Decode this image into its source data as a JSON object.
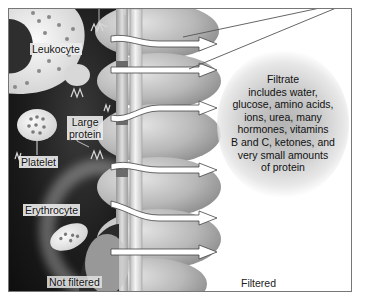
{
  "diagram": {
    "labels": {
      "leukocyte": "Leukocyte",
      "large_protein": "Large\nprotein",
      "large_protein_line1": "Large",
      "large_protein_line2": "protein",
      "platelet": "Platelet",
      "erythrocyte": "Erythrocyte",
      "not_filtered": "Not filtered",
      "filtered": "Filtered"
    },
    "filtrate": {
      "lines": [
        "Filtrate",
        "includes water,",
        "glucose, amino acids,",
        "ions, urea, many",
        "hormones, vitamins",
        "B and C, ketones, and",
        "very small amounts",
        "of protein"
      ]
    },
    "arrows_count": 6,
    "colors": {
      "blood_side_dark": "#1c1c1c",
      "membrane": "#e6e6e6",
      "podocyte": "#bdbdbd",
      "filtrate_bubble": "#b4b4b4",
      "frame_border": "#777777"
    }
  }
}
